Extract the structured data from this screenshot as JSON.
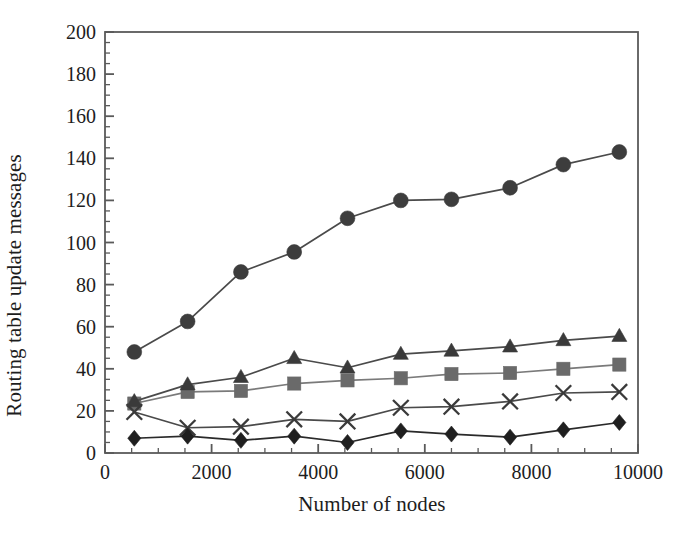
{
  "chart_data": {
    "type": "line",
    "title": "",
    "subtitle": "",
    "xlabel": "Number of nodes",
    "ylabel": "Routing table update messages",
    "xlim": [
      0,
      10000
    ],
    "ylim": [
      0,
      200
    ],
    "x_major_ticks": [
      0,
      2000,
      4000,
      6000,
      8000,
      10000
    ],
    "x_tick_labels": [
      "0",
      "2000",
      "4000",
      "6000",
      "8000",
      "10000"
    ],
    "x_minor_step": 500,
    "y_major_ticks": [
      0,
      20,
      40,
      60,
      80,
      100,
      120,
      140,
      160,
      180,
      200
    ],
    "y_tick_labels": [
      "0",
      "20",
      "40",
      "60",
      "80",
      "100",
      "120",
      "140",
      "160",
      "180",
      "200"
    ],
    "y_minor_step": 5,
    "grid": false,
    "legend_position": "none",
    "x": [
      550,
      1550,
      2550,
      3550,
      4550,
      5550,
      6500,
      7600,
      8600,
      9650
    ],
    "series": [
      {
        "name": "series-circle",
        "marker": "circle",
        "color": "#3d3d3d",
        "line_color": "#4a4a4a",
        "values": [
          48,
          62.5,
          86,
          95.5,
          111.5,
          120,
          120.5,
          126,
          137,
          143
        ]
      },
      {
        "name": "series-triangle",
        "marker": "triangle",
        "color": "#3a3a3a",
        "line_color": "#4a4a4a",
        "values": [
          24.5,
          32.5,
          36,
          45,
          40.5,
          47,
          48.5,
          50.5,
          53.5,
          55.5
        ]
      },
      {
        "name": "series-square",
        "marker": "square",
        "color": "#6a6a6a",
        "line_color": "#7a7a7a",
        "values": [
          23.5,
          29,
          29.5,
          33,
          34.5,
          35.5,
          37.5,
          38,
          40,
          42
        ]
      },
      {
        "name": "series-cross",
        "marker": "cross",
        "color": "#3a3a3a",
        "line_color": "#4a4a4a",
        "values": [
          19.5,
          12,
          12.5,
          16,
          15,
          21.5,
          22,
          24.5,
          28.5,
          29
        ]
      },
      {
        "name": "series-diamond",
        "marker": "diamond",
        "color": "#1f1f1f",
        "line_color": "#2a2a2a",
        "values": [
          7,
          8,
          6,
          8,
          5,
          10.5,
          9,
          7.5,
          11,
          14.5
        ]
      }
    ]
  },
  "plot_box": {
    "left": 105,
    "top": 32,
    "right": 638,
    "bottom": 453
  },
  "colors": {
    "frame": "#5a5a5a",
    "text": "#1d1d1d"
  }
}
